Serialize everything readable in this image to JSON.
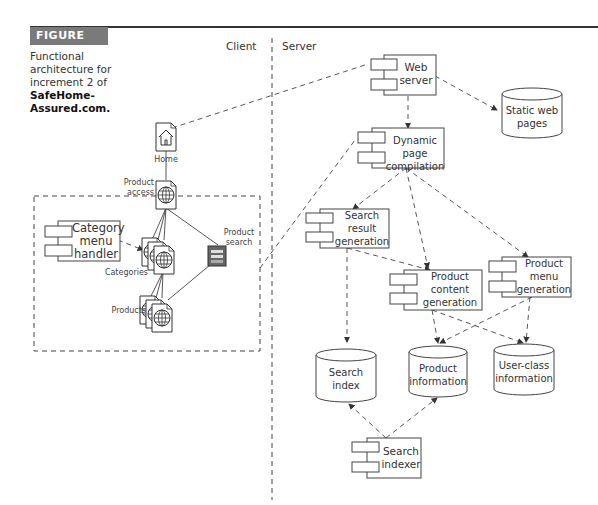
{
  "figure": {
    "badge": "FIGURE 11.5",
    "caption_lines": [
      "Functional",
      "architecture for",
      "increment 2 of"
    ],
    "caption_bold": [
      "SafeHome-",
      "Assured.com."
    ]
  },
  "regions": {
    "client": "Client",
    "server": "Server"
  },
  "client_nodes": {
    "home": "Home",
    "product_access": [
      "Product",
      "access"
    ],
    "categories": "Categories",
    "products": "Products",
    "product_search": [
      "Product",
      "search"
    ],
    "category_menu_handler": [
      "Category",
      "menu",
      "handler"
    ]
  },
  "server_components": {
    "web_server": [
      "Web",
      "server"
    ],
    "dynamic_page": [
      "Dynamic page",
      "compilation"
    ],
    "search_result": [
      "Search",
      "result",
      "generation"
    ],
    "product_content": [
      "Product",
      "content",
      "generation"
    ],
    "product_menu": [
      "Product",
      "menu",
      "generation"
    ],
    "search_indexer": [
      "Search",
      "indexer"
    ]
  },
  "datastores": {
    "static_web": [
      "Static web",
      "pages"
    ],
    "search_index": [
      "Search",
      "index"
    ],
    "product_info": [
      "Product",
      "information"
    ],
    "user_class": [
      "User-class",
      "information"
    ]
  },
  "colors": {
    "line": "#444444",
    "badge": "#7a7a7a"
  }
}
